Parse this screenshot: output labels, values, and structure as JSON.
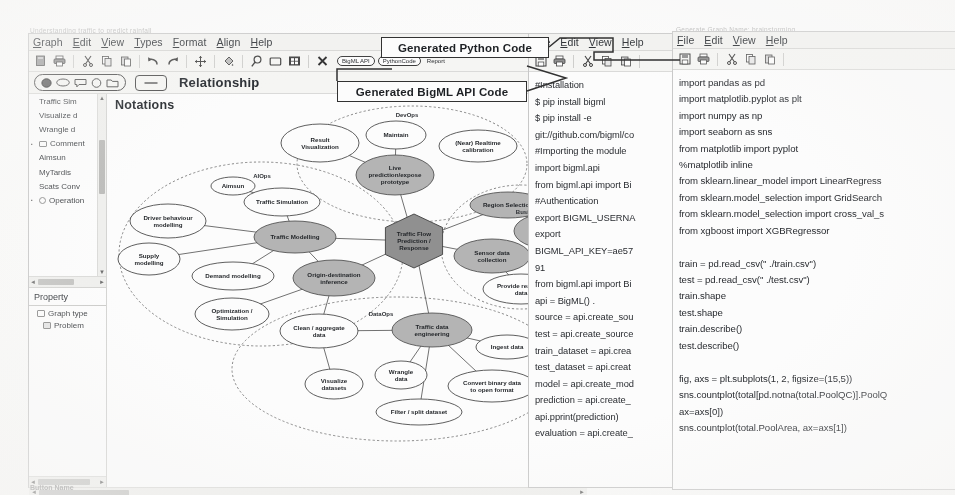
{
  "ghost_titles": {
    "left": "Understanding traffic to predict rainfall",
    "right": "Generate Graph Name: brainstorming"
  },
  "bottom_ghost": "Button Name",
  "graph_window": {
    "menus": [
      "Graph",
      "Edit",
      "View",
      "Types",
      "Format",
      "Align",
      "Help"
    ],
    "toolbar_icons": [
      "new-document-icon",
      "print-icon",
      "sep",
      "cut-icon",
      "copy-icon",
      "paste-icon",
      "sep",
      "undo-icon",
      "redo-icon",
      "sep",
      "move-icon",
      "sep",
      "fill-icon",
      "sep",
      "zoom-icon",
      "rectangle-icon",
      "fit-icon",
      "sep",
      "close-icon"
    ],
    "action_buttons": [
      {
        "label": "BigML API",
        "style": "pill"
      },
      {
        "label": "PythonCode",
        "style": "pill"
      },
      {
        "label": "Report",
        "style": "plain"
      }
    ],
    "shape_tools": [
      "filled-ellipse-icon",
      "ellipse-icon",
      "rounded-rect-icon",
      "circle-icon",
      "folder-icon"
    ],
    "relationship_tool": "line-icon",
    "relationship_label": "Relationship",
    "canvas_title": "Notations",
    "tree_items": [
      {
        "label": "Traffic Sim",
        "twisty": false,
        "icon": "none"
      },
      {
        "label": "Visualize d",
        "twisty": false,
        "icon": "none"
      },
      {
        "label": "Wrangle d",
        "twisty": false,
        "icon": "none"
      },
      {
        "label": "Comment",
        "twisty": true,
        "icon": "rect"
      },
      {
        "label": "Aimsun",
        "twisty": false,
        "icon": "none"
      },
      {
        "label": "MyTardis",
        "twisty": false,
        "icon": "none"
      },
      {
        "label": "Scats Conv",
        "twisty": false,
        "icon": "none"
      },
      {
        "label": "Operation",
        "twisty": true,
        "icon": "circ"
      }
    ],
    "property_panel": {
      "title": "Property",
      "rows": [
        {
          "label": "Graph type",
          "icon": "rect"
        },
        {
          "label": "Problem",
          "icon": "doc"
        }
      ]
    }
  },
  "callouts": {
    "python": "Generated Python Code",
    "bigml": "Generated BigML API Code"
  },
  "diagram": {
    "groups": [
      {
        "name": "DevOps",
        "x": 378,
        "y": 118
      },
      {
        "name": "AIOps",
        "x": 233,
        "y": 179
      },
      {
        "name": "BusinessOps",
        "x": 506,
        "y": 215
      },
      {
        "name": "DataOps",
        "x": 352,
        "y": 317
      }
    ],
    "nodes": [
      {
        "id": "result-visualization",
        "label": [
          "Result",
          "Visualization"
        ],
        "cx": 291,
        "cy": 144,
        "rx": 39,
        "ry": 19,
        "shade": false
      },
      {
        "id": "maintain",
        "label": [
          "Maintain"
        ],
        "cx": 367,
        "cy": 136,
        "rx": 30,
        "ry": 14,
        "shade": false
      },
      {
        "id": "near-realtime-calibration",
        "label": [
          "(Near) Realtime",
          "calibration"
        ],
        "cx": 449,
        "cy": 147,
        "rx": 39,
        "ry": 16,
        "shade": false
      },
      {
        "id": "live-prediction-prototype",
        "label": [
          "Live",
          "prediction/expose",
          "prototype"
        ],
        "cx": 366,
        "cy": 176,
        "rx": 39,
        "ry": 20,
        "shade": true
      },
      {
        "id": "traffic-simulation",
        "label": [
          "Traffic Simulation"
        ],
        "cx": 253,
        "cy": 203,
        "rx": 38,
        "ry": 14,
        "shade": false
      },
      {
        "id": "aimsun",
        "label": [
          "Aimsun"
        ],
        "cx": 204,
        "cy": 187,
        "rx": 22,
        "ry": 9,
        "shade": false
      },
      {
        "id": "driver-behaviour-modelling",
        "label": [
          "Driver behaviour",
          "modelling"
        ],
        "cx": 139,
        "cy": 222,
        "rx": 38,
        "ry": 17,
        "shade": false
      },
      {
        "id": "supply-modelling",
        "label": [
          "Supply",
          "modelling"
        ],
        "cx": 120,
        "cy": 260,
        "rx": 31,
        "ry": 16,
        "shade": false
      },
      {
        "id": "traffic-modelling",
        "label": [
          "Traffic Modelling"
        ],
        "cx": 266,
        "cy": 238,
        "rx": 41,
        "ry": 16,
        "shade": true
      },
      {
        "id": "demand-modelling",
        "label": [
          "Demand modelling"
        ],
        "cx": 204,
        "cy": 277,
        "rx": 41,
        "ry": 14,
        "shade": false
      },
      {
        "id": "origin-destination-inference",
        "label": [
          "Origin-destination",
          "inference"
        ],
        "cx": 305,
        "cy": 279,
        "rx": 41,
        "ry": 18,
        "shade": true
      },
      {
        "id": "optimization-simulation",
        "label": [
          "Optimization /",
          "Simulation"
        ],
        "cx": 203,
        "cy": 315,
        "rx": 37,
        "ry": 16,
        "shade": false
      },
      {
        "id": "traffic-flow-prediction-response",
        "label": [
          "Traffic Flow",
          "Prediction /",
          "Response"
        ],
        "cx": 385,
        "cy": 242,
        "rx": 33,
        "ry": 27,
        "shade": true,
        "shape": "hex"
      },
      {
        "id": "region-selection",
        "label": [
          "Region Selection"
        ],
        "cx": 479,
        "cy": 206,
        "rx": 38,
        "ry": 13,
        "shade": true
      },
      {
        "id": "define-traffic-performance-measures",
        "label": [
          "Define traffic",
          "performance",
          "measures"
        ],
        "cx": 522,
        "cy": 232,
        "rx": 37,
        "ry": 18,
        "shade": true
      },
      {
        "id": "sensor-data-collection",
        "label": [
          "Sensor data",
          "collection"
        ],
        "cx": 463,
        "cy": 257,
        "rx": 38,
        "ry": 17,
        "shade": true
      },
      {
        "id": "provide-realtime-data",
        "label": [
          "Provide realtime",
          "data"
        ],
        "cx": 492,
        "cy": 290,
        "rx": 38,
        "ry": 15,
        "shade": false
      },
      {
        "id": "clean-aggregate-data",
        "label": [
          "Clean / aggregate",
          "data"
        ],
        "cx": 290,
        "cy": 332,
        "rx": 39,
        "ry": 17,
        "shade": false
      },
      {
        "id": "traffic-data-engineering",
        "label": [
          "Traffic data",
          "engineering"
        ],
        "cx": 403,
        "cy": 331,
        "rx": 40,
        "ry": 17,
        "shade": true
      },
      {
        "id": "visualize-datasets",
        "label": [
          "Visualize",
          "datasets"
        ],
        "cx": 305,
        "cy": 385,
        "rx": 29,
        "ry": 15,
        "shade": false
      },
      {
        "id": "wrangle-data",
        "label": [
          "Wrangle",
          "data"
        ],
        "cx": 372,
        "cy": 376,
        "rx": 26,
        "ry": 14,
        "shade": false
      },
      {
        "id": "ingest-data",
        "label": [
          "Ingest data"
        ],
        "cx": 478,
        "cy": 348,
        "rx": 31,
        "ry": 12,
        "shade": false
      },
      {
        "id": "convert-binary-data",
        "label": [
          "Convert binary data",
          "to open format"
        ],
        "cx": 463,
        "cy": 387,
        "rx": 44,
        "ry": 16,
        "shade": false
      },
      {
        "id": "filter-split-dataset",
        "label": [
          "Filter / split dataset"
        ],
        "cx": 390,
        "cy": 413,
        "rx": 43,
        "ry": 13,
        "shade": false
      }
    ],
    "dashed_boxes": [
      {
        "label": [
          "MyTardis"
        ],
        "x": 520,
        "y": 358,
        "w": 44,
        "h": 22
      },
      {
        "label": [
          "Scats",
          "Converter"
        ],
        "x": 520,
        "y": 392,
        "w": 44,
        "h": 26
      }
    ],
    "edges": [
      [
        "traffic-simulation",
        "traffic-modelling"
      ],
      [
        "driver-behaviour-modelling",
        "traffic-modelling"
      ],
      [
        "supply-modelling",
        "traffic-modelling"
      ],
      [
        "demand-modelling",
        "traffic-modelling"
      ],
      [
        "optimization-simulation",
        "origin-destination-inference"
      ],
      [
        "traffic-modelling",
        "origin-destination-inference"
      ],
      [
        "traffic-modelling",
        "traffic-flow-prediction-response"
      ],
      [
        "origin-destination-inference",
        "traffic-flow-prediction-response"
      ],
      [
        "origin-destination-inference",
        "clean-aggregate-data"
      ],
      [
        "traffic-flow-prediction-response",
        "live-prediction-prototype"
      ],
      [
        "traffic-flow-prediction-response",
        "region-selection"
      ],
      [
        "traffic-flow-prediction-response",
        "sensor-data-collection"
      ],
      [
        "traffic-flow-prediction-response",
        "traffic-data-engineering"
      ],
      [
        "live-prediction-prototype",
        "maintain"
      ],
      [
        "live-prediction-prototype",
        "result-visualization"
      ],
      [
        "sensor-data-collection",
        "provide-realtime-data"
      ],
      [
        "region-selection",
        "define-traffic-performance-measures"
      ],
      [
        "clean-aggregate-data",
        "traffic-data-engineering"
      ],
      [
        "clean-aggregate-data",
        "visualize-datasets"
      ],
      [
        "traffic-data-engineering",
        "wrangle-data"
      ],
      [
        "traffic-data-engineering",
        "ingest-data"
      ],
      [
        "traffic-data-engineering",
        "convert-binary-data"
      ],
      [
        "traffic-data-engineering",
        "filter-split-dataset"
      ],
      [
        "aimsun",
        "traffic-simulation"
      ]
    ]
  },
  "bigml_window": {
    "menus": [
      "File",
      "Edit",
      "View",
      "Help"
    ],
    "toolbar_icons": [
      "save-icon",
      "print-icon",
      "sep",
      "cut-icon",
      "copy-icon",
      "paste-icon"
    ],
    "code_lines": [
      "#Installation",
      "$ pip install bigml",
      "$ pip install -e",
      "git://github.com/bigml/co",
      "#Importing the module",
      "import bigml.api",
      "from bigml.api import Bi",
      "#Authentication",
      "export BIGML_USERNA",
      "export",
      "BIGML_API_KEY=ae57",
      "91",
      "from bigml.api import Bi",
      "api = BigML()          .",
      "source = api.create_sou",
      "test = api.create_source",
      "train_dataset = api.crea",
      "test_dataset = api.creat",
      "model = api.create_mod",
      "prediction = api.create_",
      "api.pprint(prediction)",
      "evaluation = api.create_"
    ]
  },
  "python_window": {
    "menus": [
      "File",
      "Edit",
      "View",
      "Help"
    ],
    "toolbar_icons": [
      "save-icon",
      "print-icon",
      "sep",
      "cut-icon",
      "copy-icon",
      "paste-icon"
    ],
    "code_lines": [
      "import pandas as pd",
      "import matplotlib.pyplot as plt",
      "import numpy as np",
      "import seaborn as sns",
      "from matplotlib import pyplot",
      "%matplotlib inline",
      "from sklearn.linear_model import LinearRegress",
      "from sklearn.model_selection import GridSearch",
      "from sklearn.model_selection import cross_val_s",
      "from xgboost import XGBRegressor",
      "",
      "train = pd.read_csv(\" ./train.csv\")",
      "test = pd.read_csv(\" ./test.csv\")",
      "train.shape",
      "test.shape",
      "train.describe()",
      "test.describe()",
      "",
      "fig, axs = plt.subplots(1, 2, figsize=(15,5))",
      "sns.countplot(total[pd.notna(total.PoolQC)].PoolQ",
      "ax=axs[0])",
      "sns.countplot(total.PoolArea, ax=axs[1])"
    ]
  },
  "colors": {
    "shade_fill": "#b4b4b4",
    "hex_fill": "#8f8f8f",
    "stroke": "#3f3f3f",
    "chrome": "#f4f4f2"
  }
}
